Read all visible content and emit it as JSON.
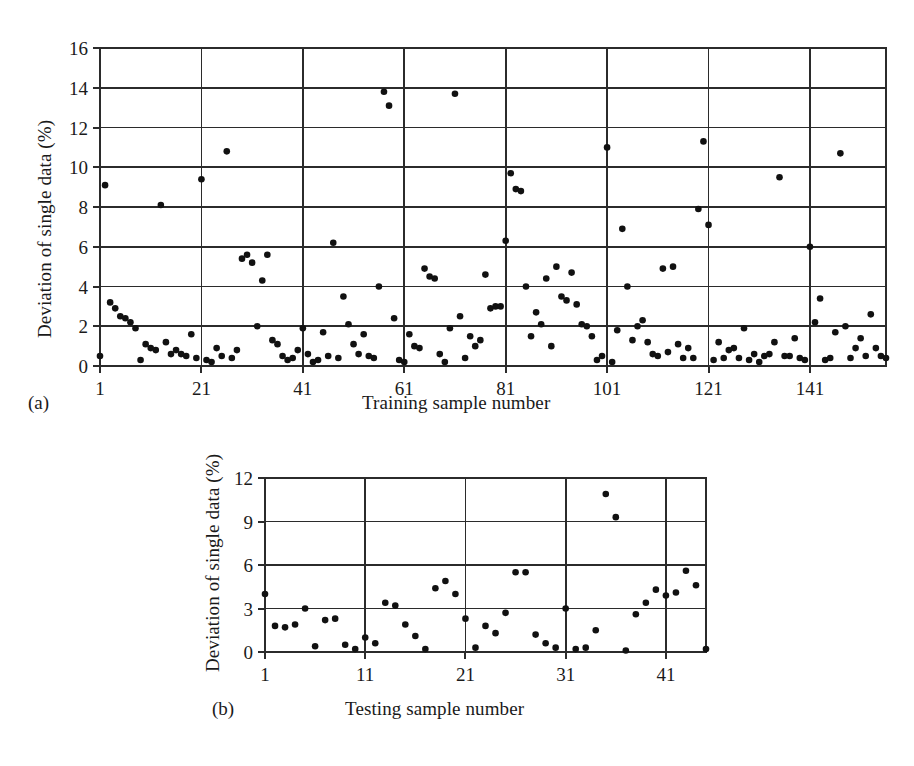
{
  "figure": {
    "background": "#ffffff",
    "ink_color": "#1a1a1a",
    "dot_color": "#111111"
  },
  "panel_a": {
    "letter": "(a)",
    "ylabel": "Deviation of single data (%)",
    "xlabel": "Training sample number"
  },
  "panel_b": {
    "letter": "(b)",
    "ylabel": "Deviation of single data (%)",
    "xlabel": "Testing sample number"
  },
  "chart_data": [
    {
      "type": "scatter",
      "panel": "(a)",
      "title": "",
      "xlabel": "Training sample number",
      "ylabel": "Deviation of single data (%)",
      "xlim": [
        1,
        156
      ],
      "ylim": [
        0,
        16
      ],
      "xticks": [
        1,
        21,
        41,
        61,
        81,
        101,
        121,
        141
      ],
      "yticks": [
        0,
        2,
        4,
        6,
        8,
        10,
        12,
        14,
        16
      ],
      "grid": true,
      "legend": null,
      "x": [
        1,
        2,
        3,
        4,
        5,
        6,
        7,
        8,
        9,
        10,
        11,
        12,
        13,
        14,
        15,
        16,
        17,
        18,
        19,
        20,
        21,
        22,
        23,
        24,
        25,
        26,
        27,
        28,
        29,
        30,
        31,
        32,
        33,
        34,
        35,
        36,
        37,
        38,
        39,
        40,
        41,
        42,
        43,
        44,
        45,
        46,
        47,
        48,
        49,
        50,
        51,
        52,
        53,
        54,
        55,
        56,
        57,
        58,
        59,
        60,
        61,
        62,
        63,
        64,
        65,
        66,
        67,
        68,
        69,
        70,
        71,
        72,
        73,
        74,
        75,
        76,
        77,
        78,
        79,
        80,
        81,
        82,
        83,
        84,
        85,
        86,
        87,
        88,
        89,
        90,
        91,
        92,
        93,
        94,
        95,
        96,
        97,
        98,
        99,
        100,
        101,
        102,
        103,
        104,
        105,
        106,
        107,
        108,
        109,
        110,
        111,
        112,
        113,
        114,
        115,
        116,
        117,
        118,
        119,
        120,
        121,
        122,
        123,
        124,
        125,
        126,
        127,
        128,
        129,
        130,
        131,
        132,
        133,
        134,
        135,
        136,
        137,
        138,
        139,
        140,
        141,
        142,
        143,
        144,
        145,
        146,
        147,
        148,
        149,
        150,
        151,
        152,
        153,
        154,
        155,
        156
      ],
      "y": [
        0.5,
        9.1,
        3.2,
        2.9,
        2.5,
        2.4,
        2.2,
        1.9,
        0.3,
        1.1,
        0.9,
        0.8,
        8.1,
        1.2,
        0.6,
        0.8,
        0.6,
        0.5,
        1.6,
        0.4,
        9.4,
        0.3,
        0.2,
        0.9,
        0.5,
        10.8,
        0.4,
        0.8,
        5.4,
        5.6,
        5.2,
        2.0,
        4.3,
        5.6,
        1.3,
        1.1,
        0.5,
        0.3,
        0.4,
        0.8,
        1.9,
        0.6,
        0.2,
        0.3,
        1.7,
        0.5,
        6.2,
        0.4,
        3.5,
        2.1,
        1.1,
        0.6,
        1.6,
        0.5,
        0.4,
        4.0,
        13.8,
        13.1,
        2.4,
        0.3,
        0.2,
        1.6,
        1.0,
        0.9,
        4.9,
        4.5,
        4.4,
        0.6,
        0.2,
        1.9,
        13.7,
        2.5,
        0.4,
        1.5,
        1.0,
        1.3,
        4.6,
        2.9,
        3.0,
        3.0,
        6.3,
        9.7,
        8.9,
        8.8,
        4.0,
        1.5,
        2.7,
        2.1,
        4.4,
        1.0,
        5.0,
        3.5,
        3.3,
        4.7,
        3.1,
        2.1,
        2.0,
        1.5,
        0.3,
        0.5,
        11.0,
        0.2,
        1.8,
        6.9,
        4.0,
        1.3,
        2.0,
        2.3,
        1.2,
        0.6,
        0.5,
        4.9,
        0.7,
        5.0,
        1.1,
        0.4,
        0.9,
        0.4,
        7.9,
        11.3,
        7.1,
        0.3,
        1.2,
        0.4,
        0.8,
        0.9,
        0.4,
        1.9,
        0.3,
        0.6,
        0.2,
        0.5,
        0.6,
        1.2,
        9.5,
        0.5,
        0.5,
        1.4,
        0.4,
        0.3,
        6.0,
        2.2,
        3.4,
        0.3,
        0.4,
        1.7,
        10.7,
        2.0,
        0.4,
        0.9,
        1.4,
        0.5,
        2.6,
        0.9,
        0.5,
        0.4
      ]
    },
    {
      "type": "scatter",
      "panel": "(b)",
      "title": "",
      "xlabel": "Testing sample number",
      "ylabel": "Deviation of single data (%)",
      "xlim": [
        1,
        45
      ],
      "ylim": [
        0,
        12
      ],
      "xticks": [
        1,
        11,
        21,
        31,
        41
      ],
      "yticks": [
        0,
        3,
        6,
        9,
        12
      ],
      "grid": true,
      "legend": null,
      "x": [
        1,
        2,
        3,
        4,
        5,
        6,
        7,
        8,
        9,
        10,
        11,
        12,
        13,
        14,
        15,
        16,
        17,
        18,
        19,
        20,
        21,
        22,
        23,
        24,
        25,
        26,
        27,
        28,
        29,
        30,
        31,
        32,
        33,
        34,
        35,
        36,
        37,
        38,
        39,
        40,
        41,
        42,
        43,
        44,
        45
      ],
      "y": [
        4.0,
        1.8,
        1.7,
        1.9,
        3.0,
        0.4,
        2.2,
        2.3,
        0.5,
        0.2,
        1.0,
        0.6,
        3.4,
        3.2,
        1.9,
        1.1,
        0.2,
        4.4,
        4.9,
        4.0,
        2.3,
        0.3,
        1.8,
        1.3,
        2.7,
        5.5,
        5.5,
        1.2,
        0.6,
        0.3,
        3.0,
        0.2,
        0.3,
        1.5,
        10.9,
        9.3,
        0.1,
        2.6,
        3.4,
        4.3,
        3.9,
        4.1,
        5.6,
        4.6,
        0.2
      ]
    }
  ]
}
